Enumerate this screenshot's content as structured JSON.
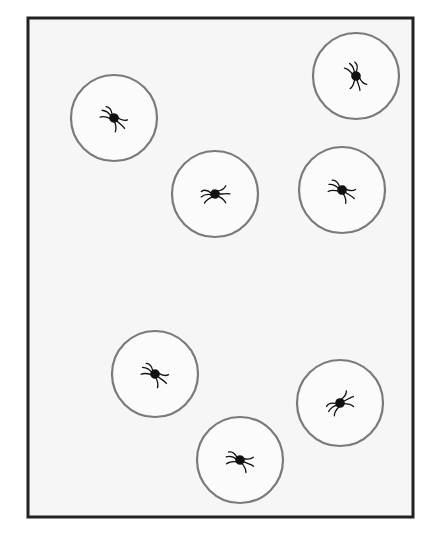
{
  "diagram": {
    "colors": {
      "background": "#ffffff",
      "frame_fill": "#f6f6f6",
      "frame_stroke": "#222222",
      "circle_fill": "#fbfbfb",
      "circle_stroke": "#7a7a7a",
      "spider": "#111111"
    },
    "frame": {
      "x": 28,
      "y": 18,
      "width": 385,
      "height": 499
    },
    "circles": [
      {
        "id": 1,
        "cx": 114,
        "cy": 118,
        "r": 43,
        "spider_angle": 25
      },
      {
        "id": 2,
        "cx": 356,
        "cy": 76,
        "r": 43,
        "spider_angle": 55
      },
      {
        "id": 3,
        "cx": 215,
        "cy": 194,
        "r": 43,
        "spider_angle": -20
      },
      {
        "id": 4,
        "cx": 342,
        "cy": 190,
        "r": 43,
        "spider_angle": 15
      },
      {
        "id": 5,
        "cx": 155,
        "cy": 374,
        "r": 43,
        "spider_angle": 20
      },
      {
        "id": 6,
        "cx": 340,
        "cy": 403,
        "r": 43,
        "spider_angle": -45
      },
      {
        "id": 7,
        "cx": 240,
        "cy": 460,
        "r": 43,
        "spider_angle": 5
      }
    ],
    "spider_count": 7
  }
}
